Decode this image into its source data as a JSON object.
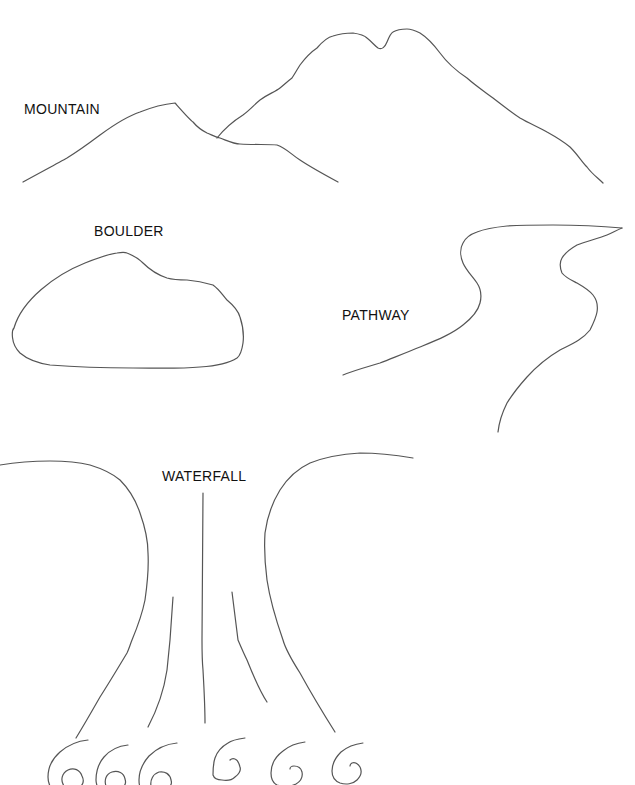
{
  "colors": {
    "background": "#ffffff",
    "stroke": "#555555",
    "label": "#111111"
  },
  "labels": {
    "mountain": "MOUNTAIN",
    "boulder": "BOULDER",
    "pathway": "PATHWAY",
    "waterfall": "WATERFALL"
  },
  "shapes": {
    "mountain": {
      "left_peak": "M23,182 C45,170 60,162 67,158 C80,150 92,141 100,135 C115,124 128,116 140,112 C155,106 165,104 175,103 C183,112 190,120 193,122 C198,128 203,131 207,133 C212,135 215,137 220,138 C228,141 234,144 240,144 C255,145 268,144 277,145 C286,148 292,155 300,160 C312,168 325,175 338,182",
      "right_peak": "M217,138 C225,128 235,120 243,115 C250,110 255,104 260,100 C268,94 275,92 280,88 C285,84 288,81 292,78 C296,72 298,68 300,65 C306,57 311,52 317,48 C323,41 328,37 333,36 C342,33 348,33 353,33 C360,34 364,35 367,38 C372,42 375,46 378,48 C382,50 385,47 387,42 C389,37 391,33 393,32 C398,29 403,29 407,29 C412,29 416,31 420,33 C428,38 434,45 440,53 C448,64 458,72 467,78 C476,86 485,92 493,98 C502,105 511,112 520,118 C530,124 539,127 547,132 C556,137 564,142 570,147 C578,155 582,162 587,167 C592,174 598,178 603,183"
    },
    "boulder": {
      "outline": "M20,353 C10,343 12,330 14,328 C22,300 55,275 85,263 C100,257 110,254 117,253 C122,252 125,252 127,253 C135,256 139,259 143,263 C150,270 158,275 167,278 C174,280 180,280 187,280 C198,281 206,283 213,285 C220,290 223,296 227,300 C233,305 238,310 240,317 C243,326 244,335 243,343 C242,350 241,355 237,358 C228,364 215,366 200,367 C178,369 155,368 133,368 C105,368 75,367 50,365 C37,363 27,359 20,353 Z"
    },
    "pathway": {
      "left_edge": "M343,375 C355,370 367,367 380,363 C395,357 408,352 420,347 C437,340 452,334 463,325 C472,318 478,311 480,303 C482,295 481,289 477,283 C472,276 466,270 463,263 C460,256 460,248 463,243 C466,237 471,234 477,232 C487,228 497,227 507,226 C522,225 537,225 553,225 C575,225 600,226 622,228",
      "right_edge": "M622,228 C617,230 612,233 607,235 C597,239 587,241 577,245 C570,249 565,253 562,258 C559,263 560,268 562,273 C566,278 571,280 577,283 C584,287 589,290 593,295 C597,300 598,306 597,312 C596,318 594,322 590,330 C582,340 572,344 560,350 C548,357 537,366 527,377 C518,387 512,395 507,403 C502,413 499,423 498,432"
    },
    "waterfall": {
      "left_bank": "M0,465 C18,462 34,461 50,461 C65,461 78,462 90,465 C103,469 113,474 120,480 C130,490 136,501 140,513 C145,527 148,540 148,553 C149,570 147,586 145,600 C142,615 137,628 132,640 C130,645 129,649 127,653 C118,668 109,683 100,697 C92,711 84,725 76,738",
      "inner_left": "M173,597 C172,612 171,626 170,640 C169,650 168,660 167,670 C164,690 157,710 148,727",
      "center": "M203,493 C203,540 202,590 202,640 C202,650 202,660 203,670 C204,688 205,705 205,723",
      "inner_right": "M232,592 C234,608 236,624 238,640 C241,647 244,654 247,660 C253,675 259,690 267,702",
      "right_bank": "M413,458 C395,455 378,453 360,453 C343,454 325,457 310,463 C297,469 287,479 280,490 C272,503 267,518 265,533 C264,549 265,565 267,580 C270,600 276,620 283,640 C286,651 293,662 300,673 C311,693 323,713 335,732",
      "swirls": [
        "M88,740 C78,741 68,745 60,752 C52,759 48,768 48,777 C48,781 49,784 50,786 M64,786 C60,780 62,773 68,770 C74,767 80,770 82,776 C84,780 83,784 81,786",
        "M128,745 C118,746 110,750 104,757 C98,764 96,772 96,780 C96,783 97,785 97,786 M106,786 C104,780 106,774 112,772 C118,770 124,773 125,779 C126,782 125,785 124,786",
        "M177,743 C166,744 156,749 149,756 C142,764 139,772 139,780 C139,783 139,785 140,786 M151,786 C150,780 153,774 159,772 C165,771 170,774 171,780 C172,783 171,785 170,786",
        "M245,738 C238,739 232,740 228,743 C221,747 217,752 215,758 C213,764 213,770 213,775 C214,778 217,780 222,780 C228,781 232,780 235,777 C239,774 241,770 240,767 C239,763 238,760 235,759 C233,758 231,759 230,760",
        "M305,742 C297,743 289,746 283,751 C275,757 271,765 271,773 C271,779 273,783 277,785 C283,787 290,787 296,784 C301,781 303,777 302,772 C301,768 298,766 294,766 C291,766 290,768 290,769",
        "M363,743 C355,744 347,747 341,752 C335,758 332,764 332,771 C332,777 335,781 340,783 C346,785 353,784 357,780 C361,776 362,771 360,767 C358,764 355,762 352,763 C350,764 350,765 350,766"
      ]
    }
  }
}
